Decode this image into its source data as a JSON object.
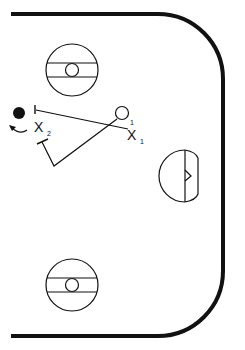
{
  "diagram": {
    "type": "hockey-play-diagram",
    "colors": {
      "line": "#111111",
      "background": "#ffffff"
    },
    "rink": {
      "shape": "half-rink-rounded-corners"
    },
    "faceoff_circles": [
      {
        "id": "top-faceoff",
        "cx": 72,
        "cy": 70,
        "r": 26
      },
      {
        "id": "bottom-faceoff",
        "cx": 72,
        "cy": 285,
        "r": 26
      }
    ],
    "goal_crease": {
      "cx": 185,
      "cy": 173
    },
    "players": [
      {
        "id": "puck-carrier",
        "symbol": "filled-circle",
        "x": 19,
        "y": 113
      },
      {
        "id": "player-circle",
        "symbol": "open-circle",
        "x": 122,
        "y": 113
      }
    ],
    "labels": {
      "x1_letter": "X",
      "x1_sub": "1",
      "x1_sup": "1",
      "x2_letter": "X",
      "x2_sub": "2"
    }
  }
}
